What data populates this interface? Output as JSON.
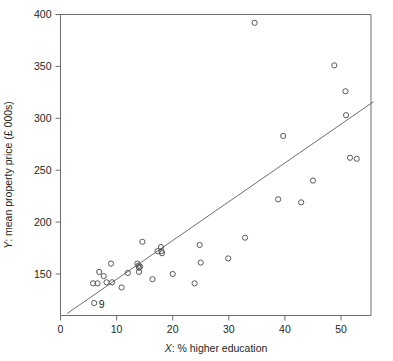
{
  "chart_data": {
    "type": "scatter",
    "title": "",
    "xlabel": "X: % higher education",
    "ylabel": "Y: mean property price (£ 000s)",
    "xlim": [
      0,
      56
    ],
    "ylim": [
      110,
      402
    ],
    "grid": false,
    "legend": null,
    "xticks": [
      0,
      10,
      20,
      30,
      40,
      50
    ],
    "xtick_labels": [
      "0",
      "10",
      "20",
      "30",
      "40",
      "50"
    ],
    "yticks": [
      150,
      200,
      250,
      300,
      350,
      400
    ],
    "ytick_labels": [
      "150",
      "200",
      "250",
      "300",
      "350",
      "400"
    ],
    "marker": "open-circle",
    "points": [
      {
        "x": 5.8,
        "y": 141
      },
      {
        "x": 6.0,
        "y": 122,
        "label": "9"
      },
      {
        "x": 6.6,
        "y": 141
      },
      {
        "x": 6.9,
        "y": 152
      },
      {
        "x": 7.7,
        "y": 148
      },
      {
        "x": 8.2,
        "y": 142
      },
      {
        "x": 9.0,
        "y": 160
      },
      {
        "x": 9.2,
        "y": 142
      },
      {
        "x": 10.9,
        "y": 137
      },
      {
        "x": 12.0,
        "y": 151
      },
      {
        "x": 13.7,
        "y": 160
      },
      {
        "x": 13.9,
        "y": 158
      },
      {
        "x": 14.0,
        "y": 156
      },
      {
        "x": 14.0,
        "y": 152
      },
      {
        "x": 14.2,
        "y": 157
      },
      {
        "x": 14.6,
        "y": 181
      },
      {
        "x": 16.4,
        "y": 145
      },
      {
        "x": 17.3,
        "y": 172
      },
      {
        "x": 17.9,
        "y": 176
      },
      {
        "x": 18.0,
        "y": 172
      },
      {
        "x": 18.1,
        "y": 170
      },
      {
        "x": 20.0,
        "y": 150
      },
      {
        "x": 23.9,
        "y": 141
      },
      {
        "x": 24.8,
        "y": 178
      },
      {
        "x": 25.0,
        "y": 161
      },
      {
        "x": 29.9,
        "y": 165
      },
      {
        "x": 32.9,
        "y": 185
      },
      {
        "x": 34.6,
        "y": 392
      },
      {
        "x": 38.8,
        "y": 222
      },
      {
        "x": 39.7,
        "y": 283
      },
      {
        "x": 42.9,
        "y": 219
      },
      {
        "x": 45.0,
        "y": 240
      },
      {
        "x": 48.8,
        "y": 351
      },
      {
        "x": 50.8,
        "y": 326
      },
      {
        "x": 50.9,
        "y": 303
      },
      {
        "x": 51.6,
        "y": 262
      },
      {
        "x": 52.8,
        "y": 261
      }
    ],
    "fit_line": {
      "type": "linear-regression",
      "x_start": 1.2,
      "y_start": 112,
      "x_end": 55.8,
      "y_end": 316
    },
    "annotations": [
      {
        "text": "9",
        "x": 6.8,
        "y": 121
      }
    ]
  },
  "colors": {
    "axis": "#6d6e71",
    "marker": "#58595b",
    "fit_line": "#6d6e71",
    "text": "#231f20",
    "background": "#ffffff"
  }
}
